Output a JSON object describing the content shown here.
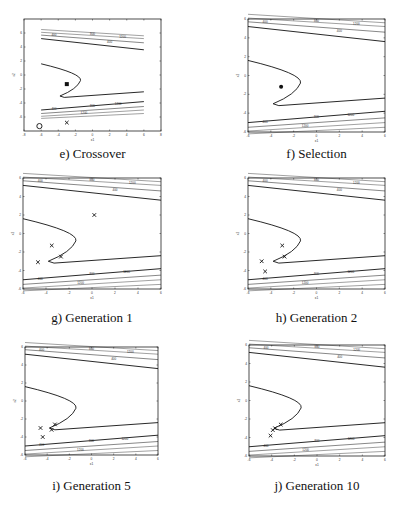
{
  "figure": {
    "panels": [
      {
        "id": "e",
        "caption": "e)  Crossover",
        "xlabel": "x1",
        "ylabel": "x2"
      },
      {
        "id": "f",
        "caption": "f)  Selection",
        "xlabel": "x1",
        "ylabel": "x2"
      },
      {
        "id": "g",
        "caption": "g)  Generation 1",
        "xlabel": "x1",
        "ylabel": "x2"
      },
      {
        "id": "h",
        "caption": "h)  Generation 2",
        "xlabel": "x1",
        "ylabel": "x2"
      },
      {
        "id": "i",
        "caption": "i)  Generation 5",
        "xlabel": "x1",
        "ylabel": "x2"
      },
      {
        "id": "j",
        "caption": "j)  Generation 10",
        "xlabel": "x1",
        "ylabel": "x2"
      }
    ]
  },
  "chart_data": [
    {
      "panel": "e",
      "type": "scatter",
      "title": "e) Crossover",
      "xlabel": "x1",
      "ylabel": "x2",
      "xlim": [
        -8,
        8
      ],
      "ylim": [
        -8,
        8
      ],
      "xticks": [
        -8,
        -6,
        -4,
        -2,
        0,
        2,
        4,
        6,
        8
      ],
      "yticks": [
        -6,
        -4,
        -2,
        0,
        2,
        4,
        6
      ],
      "contour_labels": [
        "400",
        "800",
        "1200"
      ],
      "points": [
        {
          "x": -3.0,
          "y": -1.3,
          "marker": "filled-square"
        },
        {
          "x": -3.0,
          "y": -6.8,
          "marker": "x"
        },
        {
          "x": -6.2,
          "y": -7.3,
          "marker": "circle"
        }
      ]
    },
    {
      "panel": "f",
      "type": "scatter",
      "title": "f) Selection",
      "xlabel": "x1",
      "ylabel": "x2",
      "xlim": [
        -6,
        6
      ],
      "ylim": [
        -6,
        6
      ],
      "xticks": [
        -6,
        -4,
        -2,
        0,
        2,
        4,
        6
      ],
      "yticks": [
        -6,
        -4,
        -2,
        0,
        2,
        4,
        6
      ],
      "contour_labels": [
        "400",
        "800",
        "1200"
      ],
      "points": [
        {
          "x": -3.1,
          "y": -1.2,
          "marker": "dot"
        }
      ]
    },
    {
      "panel": "g",
      "type": "scatter",
      "title": "g) Generation 1",
      "xlabel": "x1",
      "ylabel": "x2",
      "xlim": [
        -6,
        6
      ],
      "ylim": [
        -6,
        6
      ],
      "xticks": [
        -6,
        -4,
        -2,
        0,
        2,
        4,
        6
      ],
      "yticks": [
        -6,
        -4,
        -2,
        0,
        2,
        4,
        6
      ],
      "contour_labels": [
        "400",
        "800",
        "1200"
      ],
      "points": [
        {
          "x": 0.2,
          "y": 2.0,
          "marker": "x"
        },
        {
          "x": -3.5,
          "y": -1.3,
          "marker": "x"
        },
        {
          "x": -2.7,
          "y": -2.5,
          "marker": "x"
        },
        {
          "x": -4.7,
          "y": -3.1,
          "marker": "x"
        }
      ]
    },
    {
      "panel": "h",
      "type": "scatter",
      "title": "h) Generation 2",
      "xlabel": "x1",
      "ylabel": "x2",
      "xlim": [
        -6,
        6
      ],
      "ylim": [
        -6,
        6
      ],
      "xticks": [
        -6,
        -4,
        -2,
        0,
        2,
        4,
        6
      ],
      "yticks": [
        -6,
        -4,
        -2,
        0,
        2,
        4,
        6
      ],
      "contour_labels": [
        "400",
        "800",
        "1200"
      ],
      "points": [
        {
          "x": -3.0,
          "y": -1.3,
          "marker": "x"
        },
        {
          "x": -2.8,
          "y": -2.5,
          "marker": "x"
        },
        {
          "x": -4.8,
          "y": -3.0,
          "marker": "x"
        },
        {
          "x": -4.5,
          "y": -4.1,
          "marker": "x"
        }
      ]
    },
    {
      "panel": "i",
      "type": "scatter",
      "title": "i) Generation 5",
      "xlabel": "x1",
      "ylabel": "x2",
      "xlim": [
        -6,
        6
      ],
      "ylim": [
        -6,
        6
      ],
      "xticks": [
        -6,
        -4,
        -2,
        0,
        2,
        4,
        6
      ],
      "yticks": [
        -6,
        -4,
        -2,
        0,
        2,
        4,
        6
      ],
      "contour_labels": [
        "400",
        "800",
        "1200"
      ],
      "points": [
        {
          "x": -3.3,
          "y": -2.6,
          "marker": "x"
        },
        {
          "x": -3.6,
          "y": -3.2,
          "marker": "x"
        },
        {
          "x": -4.6,
          "y": -3.0,
          "marker": "x"
        },
        {
          "x": -4.4,
          "y": -4.0,
          "marker": "x"
        }
      ]
    },
    {
      "panel": "j",
      "type": "scatter",
      "title": "j) Generation 10",
      "xlabel": "x1",
      "ylabel": "x2",
      "xlim": [
        -6,
        6
      ],
      "ylim": [
        -6,
        6
      ],
      "xticks": [
        -6,
        -4,
        -2,
        0,
        2,
        4,
        6
      ],
      "yticks": [
        -6,
        -4,
        -2,
        0,
        2,
        4,
        6
      ],
      "contour_labels": [
        "400",
        "800",
        "1200"
      ],
      "points": [
        {
          "x": -3.2,
          "y": -2.6,
          "marker": "x"
        },
        {
          "x": -3.7,
          "y": -3.0,
          "marker": "x"
        },
        {
          "x": -3.9,
          "y": -3.2,
          "marker": "x"
        },
        {
          "x": -4.1,
          "y": -3.8,
          "marker": "x"
        }
      ]
    }
  ]
}
